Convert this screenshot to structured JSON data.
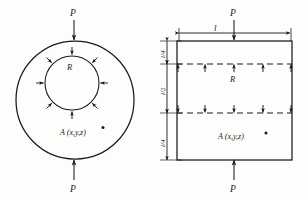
{
  "figure": {
    "type": "engineering-diagram",
    "background_color": "#fdfdfc",
    "ink_color": "#1a1a1a"
  },
  "left_view": {
    "name": "circular-cross-section",
    "load_top_label": "P",
    "load_bottom_label": "P",
    "radius_label": "R",
    "point_label": "A (x,y,z)",
    "outer_circle": {
      "cx": 75,
      "cy": 100,
      "r": 59
    },
    "inner_circle": {
      "cx": 72,
      "cy": 83,
      "r": 27
    },
    "inner_arrow_count": 8
  },
  "right_view": {
    "name": "longitudinal-section",
    "load_top_label": "P",
    "load_bottom_label": "P",
    "length_label": "l",
    "radius_label": "R",
    "point_label": "A (x,y,z)",
    "dim_top_label": "l/4",
    "dim_mid_label": "l/2",
    "dim_bottom_label": "l/4",
    "rect": {
      "x": 177,
      "y": 41,
      "w": 115,
      "h": 119
    },
    "upper_dashed_y": 64,
    "lower_dashed_y": 113,
    "upper_arrow_count": 5,
    "lower_arrow_count": 5
  }
}
